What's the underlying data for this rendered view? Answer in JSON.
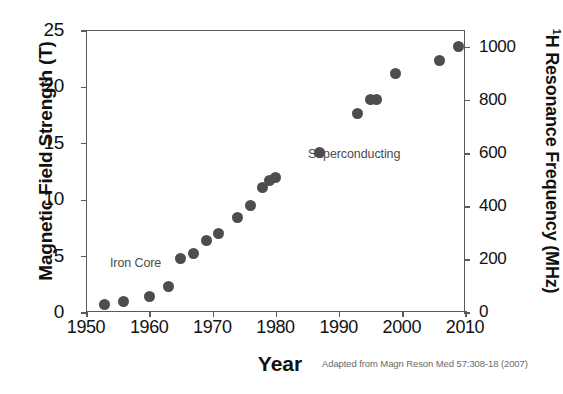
{
  "chart_data": {
    "type": "scatter",
    "title": "",
    "xlabel": "Year",
    "ylabel": "Magnetic Field Strength (T)",
    "y2label": "¹H Resonance Frequency (MHz)",
    "xlim": [
      1950,
      2010
    ],
    "ylim": [
      0,
      25
    ],
    "y2lim": [
      0,
      1063
    ],
    "grid": false,
    "legend": null,
    "xticks": [
      "1950",
      "1960",
      "1970",
      "1980",
      "1990",
      "2000",
      "2010"
    ],
    "yticks": [
      "0",
      "5",
      "10",
      "15",
      "20",
      "25"
    ],
    "y2ticks": [
      "0",
      "200",
      "400",
      "600",
      "800",
      "1000"
    ],
    "series": [
      {
        "name": "NMR magnet field strength",
        "x": [
          1953,
          1956,
          1960,
          1963,
          1965,
          1967,
          1969,
          1971,
          1974,
          1976,
          1978,
          1979,
          1980,
          1987,
          1993,
          1995,
          1996,
          1999,
          2006,
          2009
        ],
        "values": [
          0.7,
          0.9,
          1.4,
          2.3,
          4.7,
          5.2,
          6.3,
          7.0,
          8.4,
          9.4,
          11.0,
          11.7,
          11.9,
          14.1,
          17.6,
          18.8,
          18.8,
          21.1,
          22.3,
          23.5
        ]
      }
    ],
    "annotations": [
      {
        "text": "Iron Core",
        "x": 1956,
        "y": 0.2
      },
      {
        "text": "Superconducting",
        "x": 1987,
        "y": 11.5
      }
    ],
    "credit": "Adapted from Magn Reson Med 57:308-18 (2007)",
    "watermark": "",
    "colors": {
      "marker": "#4d4d4d",
      "axis": "#5a5a5a",
      "text": "#111111",
      "annotation": "#4b4b4b",
      "credit": "#6a6a6a",
      "background": "#ffffff"
    }
  }
}
